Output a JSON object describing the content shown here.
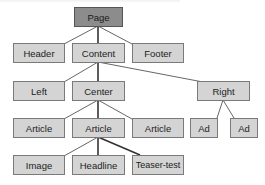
{
  "diagram": {
    "type": "tree",
    "colors": {
      "root_fill": "#8c8c8c",
      "node_fill": "#d4d4d4",
      "border": "#7a7a7a",
      "edge": "#555555"
    },
    "nodes": {
      "page": {
        "label": "Page"
      },
      "header": {
        "label": "Header"
      },
      "content": {
        "label": "Content"
      },
      "footer": {
        "label": "Footer"
      },
      "left": {
        "label": "Left"
      },
      "center": {
        "label": "Center"
      },
      "right": {
        "label": "Right"
      },
      "article1": {
        "label": "Article"
      },
      "article2": {
        "label": "Article"
      },
      "article3": {
        "label": "Article"
      },
      "ad1": {
        "label": "Ad"
      },
      "ad2": {
        "label": "Ad"
      },
      "image": {
        "label": "Image"
      },
      "headline": {
        "label": "Headline"
      },
      "teaser": {
        "label": "Teaser-test"
      }
    },
    "edges": [
      [
        "Page",
        "Header"
      ],
      [
        "Page",
        "Content"
      ],
      [
        "Page",
        "Footer"
      ],
      [
        "Content",
        "Left"
      ],
      [
        "Content",
        "Center"
      ],
      [
        "Content",
        "Right"
      ],
      [
        "Center",
        "Article"
      ],
      [
        "Center",
        "Article"
      ],
      [
        "Center",
        "Article"
      ],
      [
        "Right",
        "Ad"
      ],
      [
        "Right",
        "Ad"
      ],
      [
        "Article",
        "Image"
      ],
      [
        "Article",
        "Headline"
      ],
      [
        "Article",
        "Teaser-test"
      ]
    ]
  }
}
